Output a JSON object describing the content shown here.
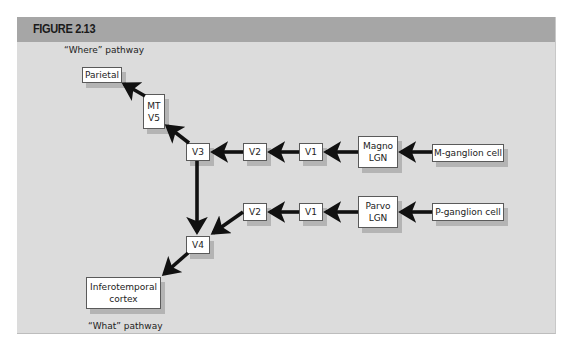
{
  "figure": {
    "title": "FIGURE 2.13",
    "where_label": "“Where” pathway",
    "what_label": "“What” pathway",
    "colors": {
      "header_bg": "#a6a6a6",
      "panel_bg": "#dcdcdc",
      "arrow": "#111111",
      "box_bg": "#ffffff",
      "box_shadow": "#b4b4b4"
    }
  },
  "nodes": {
    "parietal": "Parietal",
    "mt_v5_line1": "MT",
    "mt_v5_line2": "V5",
    "v3": "V3",
    "v2_magno": "V2",
    "v1_magno": "V1",
    "magno_lgn_line1": "Magno",
    "magno_lgn_line2": "LGN",
    "m_ganglion": "M-ganglion cell",
    "v4": "V4",
    "v2_parvo": "V2",
    "v1_parvo": "V1",
    "parvo_lgn_line1": "Parvo",
    "parvo_lgn_line2": "LGN",
    "p_ganglion": "P-ganglion cell",
    "inferotemporal_line1": "Inferotemporal",
    "inferotemporal_line2": "cortex"
  },
  "edges": [
    {
      "from": "M-ganglion cell",
      "to": "Magno LGN"
    },
    {
      "from": "Magno LGN",
      "to": "V1"
    },
    {
      "from": "V1",
      "to": "V2"
    },
    {
      "from": "V2",
      "to": "V3"
    },
    {
      "from": "V3",
      "to": "MT V5"
    },
    {
      "from": "MT V5",
      "to": "Parietal"
    },
    {
      "from": "V3",
      "to": "V4"
    },
    {
      "from": "P-ganglion cell",
      "to": "Parvo LGN"
    },
    {
      "from": "Parvo LGN",
      "to": "V1"
    },
    {
      "from": "V1",
      "to": "V2"
    },
    {
      "from": "V2",
      "to": "V4"
    },
    {
      "from": "V4",
      "to": "Inferotemporal cortex"
    }
  ]
}
